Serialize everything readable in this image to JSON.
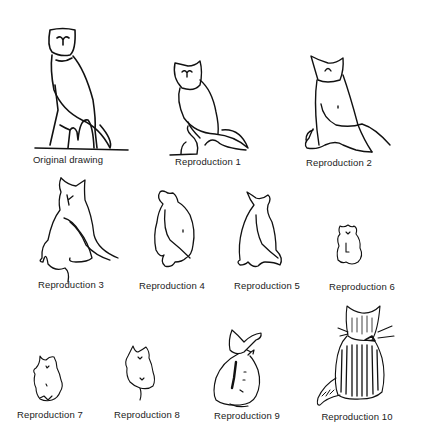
{
  "figure": {
    "panels": [
      {
        "id": "original",
        "label": "Original drawing",
        "subject": "owl-like outline drawing on base",
        "x": 68,
        "y": 160
      },
      {
        "id": "rep1",
        "label": "Reproduction 1",
        "subject": "owl outline",
        "x": 208,
        "y": 162
      },
      {
        "id": "rep2",
        "label": "Reproduction 2",
        "subject": "owl/cat hybrid outline",
        "x": 339,
        "y": 163
      },
      {
        "id": "rep3",
        "label": "Reproduction 3",
        "subject": "cat seated, rear view, with tail",
        "x": 71,
        "y": 285
      },
      {
        "id": "rep4",
        "label": "Reproduction 4",
        "subject": "cat seated outline",
        "x": 171,
        "y": 286
      },
      {
        "id": "rep5",
        "label": "Reproduction 5",
        "subject": "cat seated outline",
        "x": 266,
        "y": 286
      },
      {
        "id": "rep6",
        "label": "Reproduction 6",
        "subject": "small furry cat outline",
        "x": 362,
        "y": 287
      },
      {
        "id": "rep7",
        "label": "Reproduction 7",
        "subject": "small furry cat",
        "x": 50,
        "y": 415
      },
      {
        "id": "rep8",
        "label": "Reproduction 8",
        "subject": "furry cat with tail",
        "x": 147,
        "y": 415
      },
      {
        "id": "rep9",
        "label": "Reproduction 9",
        "subject": "cat with bow, shaded",
        "x": 247,
        "y": 416
      },
      {
        "id": "rep10",
        "label": "Reproduction 10",
        "subject": "striped cat with whiskers and bow, rear view",
        "x": 357,
        "y": 417
      }
    ]
  }
}
